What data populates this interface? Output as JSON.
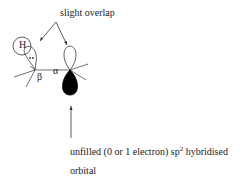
{
  "labels": {
    "top": "slight overlap",
    "h_atom": "H",
    "beta": "β",
    "alpha": "α",
    "bottom_line1_pre": "unfilled (0 or 1 electron) sp",
    "bottom_line1_sup": "2",
    "bottom_line1_post": " hybridised",
    "bottom_line2": "orbital"
  }
}
